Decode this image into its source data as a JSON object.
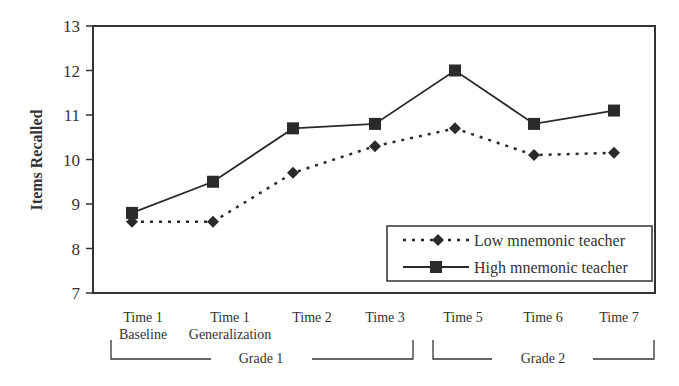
{
  "chart_data": {
    "type": "line",
    "title": "",
    "xlabel": "",
    "ylabel": "Items Recalled",
    "ylim": [
      7,
      13
    ],
    "yticks": [
      7,
      8,
      9,
      10,
      11,
      12,
      13
    ],
    "grid": false,
    "legend_position": "lower right (inside plot)",
    "categories": [
      [
        "Time 1",
        "Baseline"
      ],
      [
        "Time 1",
        "Generalization"
      ],
      [
        "Time 2"
      ],
      [
        "Time 3"
      ],
      [
        "Time 5"
      ],
      [
        "Time 6"
      ],
      [
        "Time 7"
      ]
    ],
    "groups": [
      {
        "label": "Grade 1",
        "span": [
          0,
          3
        ]
      },
      {
        "label": "Grade 2",
        "span": [
          4,
          6
        ]
      }
    ],
    "series": [
      {
        "name": "Low mnemonic teacher",
        "style": "dotted",
        "marker": "diamond",
        "values": [
          8.6,
          8.6,
          9.7,
          10.3,
          10.7,
          10.1,
          10.15
        ]
      },
      {
        "name": "High mnemonic teacher",
        "style": "solid",
        "marker": "square",
        "values": [
          8.8,
          9.5,
          10.7,
          10.8,
          12.0,
          10.8,
          11.1
        ]
      }
    ]
  },
  "axis": {
    "ylabel": "Items Recalled",
    "yticks": [
      "7",
      "8",
      "9",
      "10",
      "11",
      "12",
      "13"
    ]
  },
  "xaxis": {
    "labels": [
      {
        "line1": "Time 1",
        "line2": "Baseline"
      },
      {
        "line1": "Time 1",
        "line2": "Generalization"
      },
      {
        "line1": "Time 2",
        "line2": ""
      },
      {
        "line1": "Time 3",
        "line2": ""
      },
      {
        "line1": "Time 5",
        "line2": ""
      },
      {
        "line1": "Time 6",
        "line2": ""
      },
      {
        "line1": "Time 7",
        "line2": ""
      }
    ],
    "groups": [
      "Grade 1",
      "Grade 2"
    ]
  },
  "legend": {
    "items": [
      "Low mnemonic teacher",
      "High mnemonic teacher"
    ]
  },
  "colors": {
    "line": "#2a2a2a",
    "axis": "#333333"
  }
}
